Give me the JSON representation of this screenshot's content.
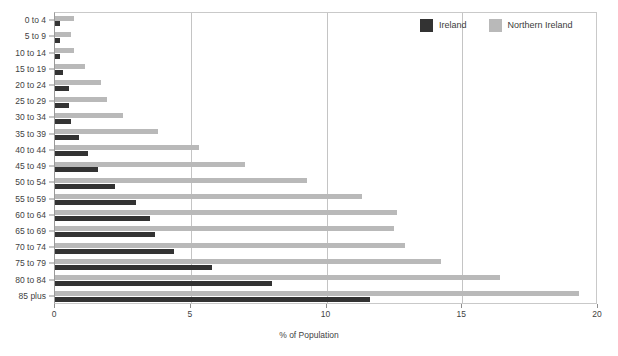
{
  "legend": {
    "position": "top-right",
    "entries": [
      {
        "label": "Ireland",
        "color": "#333333",
        "icon": "square-swatch-icon"
      },
      {
        "label": "Northern Ireland",
        "color": "#b9b9b9",
        "icon": "square-swatch-icon"
      }
    ]
  },
  "axis": {
    "x_title": "% of Population",
    "x_ticks": [
      "0",
      "5",
      "10",
      "15",
      "20"
    ]
  },
  "chart_data": {
    "type": "bar",
    "orientation": "horizontal",
    "title": "",
    "subtitle": "",
    "xlabel": "% of Population",
    "ylabel": "",
    "xlim": [
      0,
      20
    ],
    "xticks": [
      0,
      5,
      10,
      15,
      20
    ],
    "grid": "vertical-only",
    "legend_position": "top-right",
    "categories": [
      "0 to 4",
      "5 to 9",
      "10 to 14",
      "15 to 19",
      "20 to 24",
      "25 to 29",
      "30 to 34",
      "35 to 39",
      "40 to 44",
      "45 to 49",
      "50 to 54",
      "55 to 59",
      "60 to 64",
      "65 to 69",
      "70 to 74",
      "75 to 79",
      "80 to 84",
      "85 plus"
    ],
    "series": [
      {
        "name": "Ireland",
        "color": "#333333",
        "values": [
          0.2,
          0.2,
          0.2,
          0.3,
          0.5,
          0.5,
          0.6,
          0.9,
          1.2,
          1.6,
          2.2,
          3.0,
          3.5,
          3.7,
          4.4,
          5.8,
          8.0,
          11.6
        ]
      },
      {
        "name": "Northern Ireland",
        "color": "#b9b9b9",
        "values": [
          0.7,
          0.6,
          0.7,
          1.1,
          1.7,
          1.9,
          2.5,
          3.8,
          5.3,
          7.0,
          9.3,
          11.3,
          12.6,
          12.5,
          12.9,
          14.2,
          16.4,
          19.3
        ]
      }
    ]
  }
}
